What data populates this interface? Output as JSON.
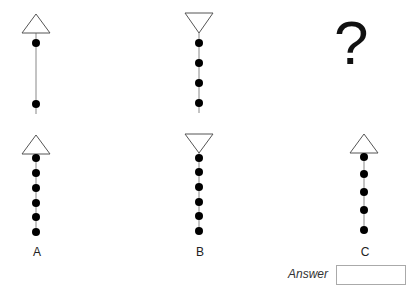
{
  "puzzle": {
    "question_mark": "?",
    "sequence": [
      {
        "triangle": "up",
        "dots": 2,
        "spread": "wide"
      },
      {
        "triangle": "down",
        "dots": 4,
        "spread": "even"
      },
      {
        "placeholder": "?"
      }
    ],
    "options": [
      {
        "label": "A",
        "triangle": "up",
        "dots": 6
      },
      {
        "label": "B",
        "triangle": "down",
        "dots": 6
      },
      {
        "label": "C",
        "triangle": "up",
        "dots": 5
      }
    ],
    "answer": {
      "label": "Answer",
      "value": ""
    }
  },
  "colors": {
    "stroke": "#555555",
    "dot": "#000000",
    "line": "#888888"
  }
}
